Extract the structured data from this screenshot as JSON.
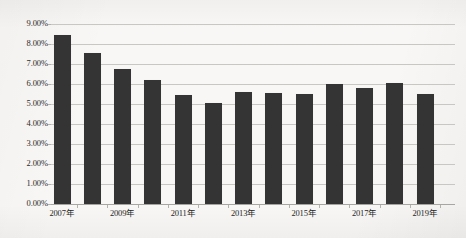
{
  "chart_data": {
    "type": "bar",
    "title": "",
    "xlabel": "",
    "ylabel": "",
    "ylim": [
      0,
      9
    ],
    "ytick_labels": [
      "9.00%",
      "8.00%",
      "7.00%",
      "6.00%",
      "5.00%",
      "4.00%",
      "3.00%",
      "2.00%",
      "1.00%",
      "0.00%"
    ],
    "ytick_values": [
      9,
      8,
      7,
      6,
      5,
      4,
      3,
      2,
      1,
      0
    ],
    "grid": true,
    "legend": "none",
    "categories": [
      "2007年",
      "2008年",
      "2009年",
      "2010年",
      "2011年",
      "2012年",
      "2013年",
      "2014年",
      "2015年",
      "2016年",
      "2017年",
      "2018年",
      "2019年"
    ],
    "xtick_labels_shown": [
      "2007年",
      "2009年",
      "2011年",
      "2013年",
      "2015年",
      "2017年",
      "2019年"
    ],
    "values": [
      8.45,
      7.55,
      6.75,
      6.2,
      5.45,
      5.05,
      5.6,
      5.55,
      5.5,
      6.0,
      5.8,
      6.05,
      5.5
    ],
    "value_labels": [
      "8.45%",
      "7.55%",
      "6.75%",
      "6.20%",
      "5.45%",
      "5.05%",
      "5.60%",
      "5.55%",
      "5.50%",
      "6.00%",
      "5.80%",
      "6.05%",
      "5.50%"
    ],
    "bar_color": "#343434",
    "gridline_color": "#c9c7c4",
    "background_color": "#f8f7f5"
  }
}
